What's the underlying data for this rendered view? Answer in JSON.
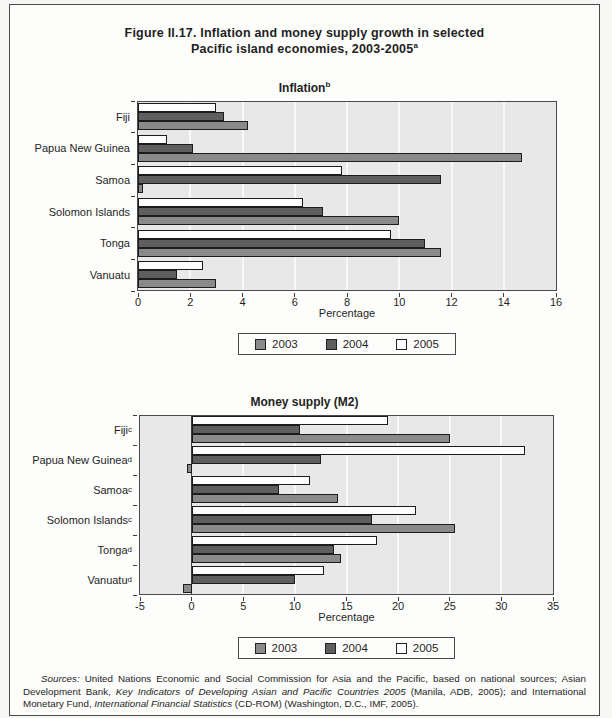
{
  "figure": {
    "title_line1": "Figure II.17.  Inflation and money supply growth in selected",
    "title_line2": "Pacific island economies, 2003-2005",
    "title_superscript": "a"
  },
  "colors": {
    "series_2003": "#8a8a8a",
    "series_2004": "#5e5e5e",
    "series_2005": "#fdfdfd",
    "bar_border": "#1c1c1c",
    "plot_background": "#e8e8e8",
    "gridline": "#f8f8f6",
    "axis": "#3c3c3c",
    "page_background": "#fdfdfb"
  },
  "legend": {
    "items": [
      {
        "label": "2003",
        "color": "series_2003"
      },
      {
        "label": "2004",
        "color": "series_2004"
      },
      {
        "label": "2005",
        "color": "series_2005"
      }
    ]
  },
  "chart_data": [
    {
      "type": "bar",
      "orientation": "horizontal",
      "title": "Inflation",
      "title_superscript": "b",
      "categories": [
        {
          "label": "Fiji",
          "sup": ""
        },
        {
          "label": "Papua New Guinea",
          "sup": ""
        },
        {
          "label": "Samoa",
          "sup": ""
        },
        {
          "label": "Solomon Islands",
          "sup": ""
        },
        {
          "label": "Tonga",
          "sup": ""
        },
        {
          "label": "Vanuatu",
          "sup": ""
        }
      ],
      "series": [
        {
          "name": "2003",
          "values": [
            4.2,
            14.7,
            0.2,
            10.0,
            11.6,
            3.0
          ]
        },
        {
          "name": "2004",
          "values": [
            3.3,
            2.1,
            11.6,
            7.1,
            11.0,
            1.5
          ]
        },
        {
          "name": "2005",
          "values": [
            3.0,
            1.1,
            7.8,
            6.3,
            9.7,
            2.5
          ]
        }
      ],
      "bar_order_top_to_bottom": [
        "2005",
        "2004",
        "2003"
      ],
      "xlabel": "Percentage",
      "xlim": [
        0,
        16
      ],
      "xticks": [
        0,
        2,
        4,
        6,
        8,
        10,
        12,
        14,
        16
      ],
      "grid": true,
      "legend_position": "bottom"
    },
    {
      "type": "bar",
      "orientation": "horizontal",
      "title": "Money supply (M2)",
      "title_superscript": "",
      "categories": [
        {
          "label": "Fiji",
          "sup": "c"
        },
        {
          "label": "Papua New Guinea",
          "sup": "d"
        },
        {
          "label": "Samoa",
          "sup": "c"
        },
        {
          "label": "Solomon Islands",
          "sup": "c"
        },
        {
          "label": "Tonga",
          "sup": "d"
        },
        {
          "label": "Vanuatu",
          "sup": "d"
        }
      ],
      "series": [
        {
          "name": "2003",
          "values": [
            25.0,
            -0.4,
            14.2,
            25.5,
            14.5,
            -0.8
          ]
        },
        {
          "name": "2004",
          "values": [
            10.5,
            12.5,
            8.5,
            17.5,
            13.8,
            10.0
          ]
        },
        {
          "name": "2005",
          "values": [
            19.0,
            32.3,
            11.5,
            21.7,
            18.0,
            12.8
          ]
        }
      ],
      "bar_order_top_to_bottom": [
        "2005",
        "2004",
        "2003"
      ],
      "xlabel": "Percentage",
      "xlim": [
        -5,
        35
      ],
      "xticks": [
        -5,
        0,
        5,
        10,
        15,
        20,
        25,
        30,
        35
      ],
      "grid": true,
      "legend_position": "bottom"
    }
  ],
  "footer": {
    "segments": [
      {
        "text": "Sources:",
        "italic": true
      },
      {
        "text": "  United Nations Economic and Social Commission for Asia and the Pacific, based on national sources; Asian Development Bank, ",
        "italic": false
      },
      {
        "text": "Key Indicators of Developing Asian and Pacific Countries 2005",
        "italic": true
      },
      {
        "text": " (Manila, ADB, 2005); and International Monetary Fund, ",
        "italic": false
      },
      {
        "text": "International Financial Statistics",
        "italic": true
      },
      {
        "text": " (CD-ROM) (Washington, D.C., IMF, 2005).",
        "italic": false
      }
    ]
  }
}
